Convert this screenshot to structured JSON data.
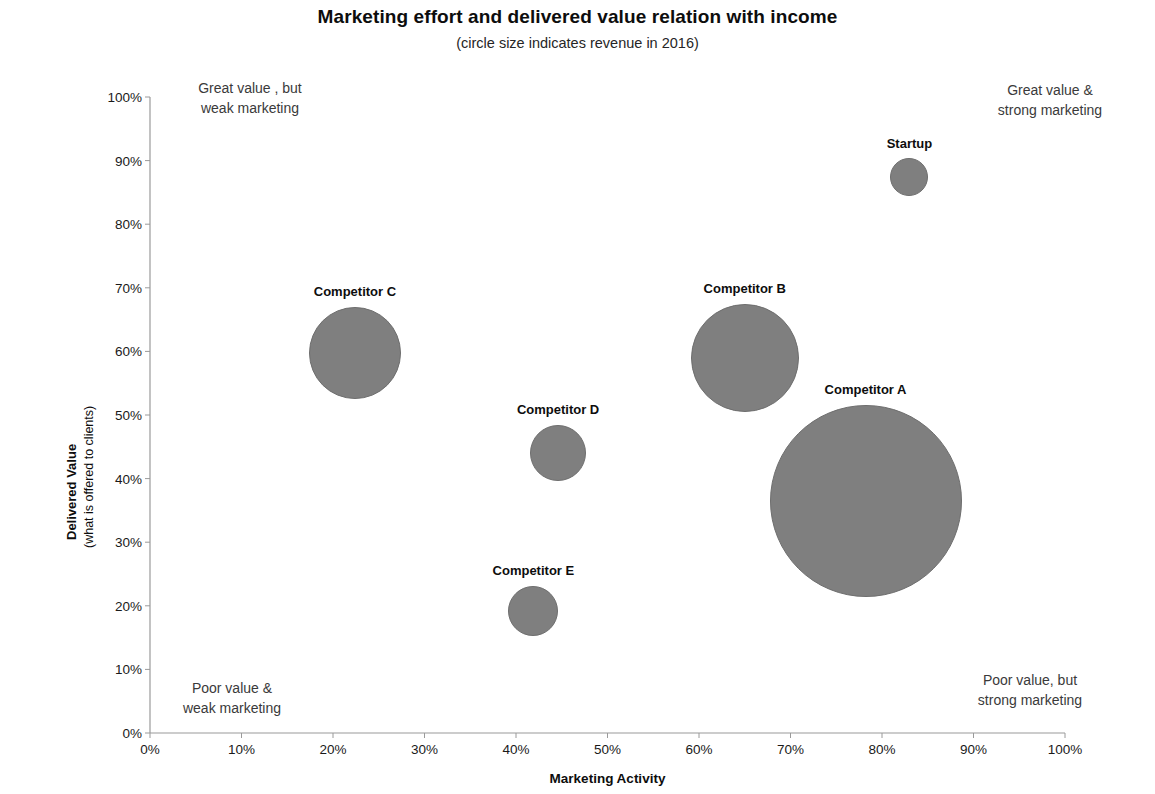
{
  "chart_title": "Marketing effort and delivered value relation with income",
  "chart_subtitle": "(circle size indicates revenue in 2016)",
  "axes": {
    "x_title": "Marketing Activity",
    "y_title": "Delivered Value",
    "y_subtitle": "(what is offered to clients)"
  },
  "annotations": {
    "top_left": "Great value , but\nweak marketing",
    "top_right": "Great value &\nstrong marketing",
    "bottom_left": "Poor value &\nweak  marketing",
    "bottom_right": "Poor  value, but\nstrong marketing"
  },
  "colors": {
    "bubble_fill": "#7f7f7f",
    "bubble_stroke": "#6e6e6e",
    "axis": "#9a9a9a",
    "text": "#0d0d0d"
  },
  "chart_data": {
    "type": "scatter",
    "title": "Marketing effort and delivered value relation with income",
    "subtitle": "(circle size indicates revenue in 2016)",
    "xlabel": "Marketing Activity",
    "ylabel": "Delivered Value (what is offered to clients)",
    "xlim": [
      0,
      100
    ],
    "ylim": [
      0,
      100
    ],
    "x_ticks": [
      "0%",
      "10%",
      "20%",
      "30%",
      "40%",
      "50%",
      "60%",
      "70%",
      "80%",
      "90%",
      "100%"
    ],
    "y_ticks": [
      "0%",
      "10%",
      "20%",
      "30%",
      "40%",
      "50%",
      "60%",
      "70%",
      "80%",
      "90%",
      "100%"
    ],
    "x_tick_values": [
      0,
      10,
      20,
      30,
      40,
      50,
      60,
      70,
      80,
      90,
      100
    ],
    "y_tick_values": [
      0,
      10,
      20,
      30,
      40,
      50,
      60,
      70,
      80,
      90,
      100
    ],
    "grid": false,
    "legend": "none",
    "size_meaning": "circle size indicates revenue in 2016",
    "points": [
      {
        "label": "Startup",
        "x": 83.0,
        "y": 87.5,
        "r_px": 19,
        "label_dy": -26
      },
      {
        "label": "Competitor A",
        "x": 78.2,
        "y": 36.5,
        "r_px": 96,
        "label_dy": -104
      },
      {
        "label": "Competitor B",
        "x": 65.0,
        "y": 59.0,
        "r_px": 54,
        "label_dy": -62
      },
      {
        "label": "Competitor C",
        "x": 22.4,
        "y": 59.8,
        "r_px": 46,
        "label_dy": -54
      },
      {
        "label": "Competitor D",
        "x": 44.6,
        "y": 44.0,
        "r_px": 28,
        "label_dy": -36
      },
      {
        "label": "Competitor E",
        "x": 41.9,
        "y": 19.2,
        "r_px": 25,
        "label_dy": -33
      }
    ]
  }
}
